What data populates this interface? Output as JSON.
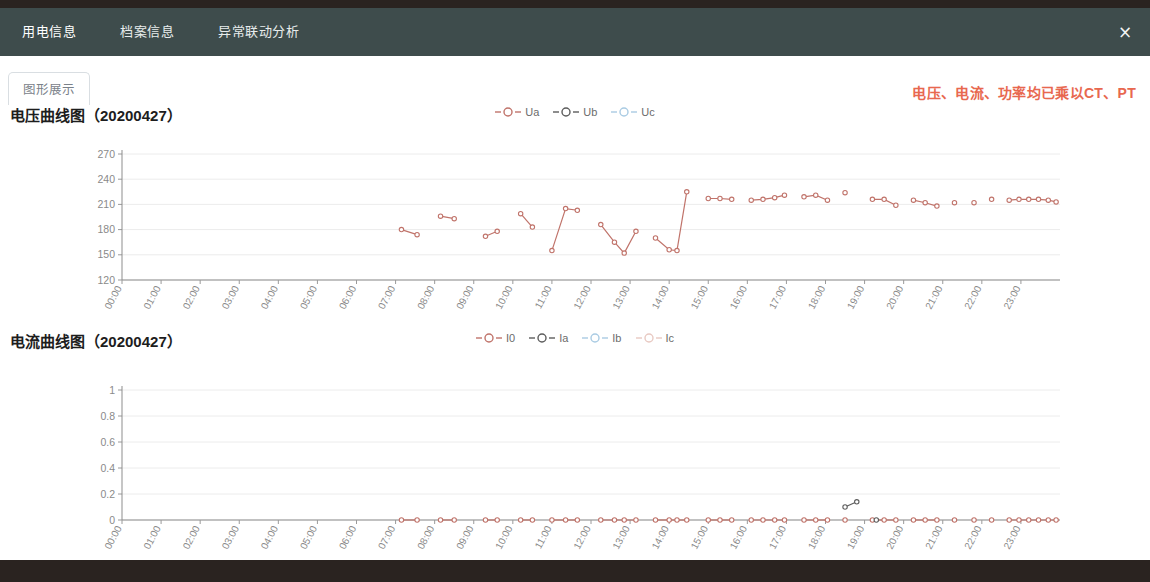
{
  "window": {
    "close_label": "×"
  },
  "nav": {
    "tabs": [
      {
        "label": "用电信息",
        "active": true
      },
      {
        "label": "档案信息",
        "active": false
      },
      {
        "label": "异常联动分析",
        "active": false
      }
    ]
  },
  "subtab": {
    "label": "图形展示"
  },
  "notice": {
    "text": "电压、电流、功率均已乘以CT、PT",
    "color": "#e8684f"
  },
  "colors": {
    "series_ua": "#c0736a",
    "series_ub": "#5c5c5c",
    "series_uc": "#a9cbe3",
    "series_i0": "#c0736a",
    "series_ia": "#5c5c5c",
    "series_ib": "#a9cbe3",
    "series_ic": "#e8c9c2",
    "grid": "#ececec",
    "axis": "#8d8d8d",
    "topbar": "#3e4c4c",
    "footer": "#2a2320"
  },
  "chart_data": [
    {
      "type": "line",
      "id": "voltage",
      "title": "电压曲线图（20200427）",
      "xlabel": "",
      "ylabel": "",
      "ylim": [
        120,
        270
      ],
      "yticks": [
        120,
        150,
        180,
        210,
        240,
        270
      ],
      "grid": true,
      "legend_position": "top-center",
      "x": [
        "00:00",
        "01:00",
        "02:00",
        "03:00",
        "04:00",
        "05:00",
        "06:00",
        "07:00",
        "08:00",
        "09:00",
        "10:00",
        "11:00",
        "12:00",
        "13:00",
        "14:00",
        "15:00",
        "16:00",
        "17:00",
        "18:00",
        "19:00",
        "20:00",
        "21:00",
        "22:00",
        "23:00"
      ],
      "xticks": [
        "00:00",
        "01:00",
        "02:00",
        "03:00",
        "04:00",
        "05:00",
        "06:00",
        "07:00",
        "08:00",
        "09:00",
        "10:00",
        "11:00",
        "12:00",
        "13:00",
        "14:00",
        "15:00",
        "16:00",
        "17:00",
        "18:00",
        "19:00",
        "20:00",
        "21:00",
        "22:00",
        "23:00"
      ],
      "series": [
        {
          "name": "Ua",
          "color": "#c0736a",
          "points": [
            {
              "t": 7.15,
              "v": 180
            },
            {
              "t": 7.55,
              "v": 174
            },
            {
              "t": 8.15,
              "v": 196
            },
            {
              "t": 8.5,
              "v": 193
            },
            {
              "t": 9.3,
              "v": 172
            },
            {
              "t": 9.6,
              "v": 178
            },
            {
              "t": 10.2,
              "v": 199
            },
            {
              "t": 10.5,
              "v": 183
            },
            {
              "t": 11.0,
              "v": 155
            },
            {
              "t": 11.35,
              "v": 205
            },
            {
              "t": 11.65,
              "v": 203
            },
            {
              "t": 12.25,
              "v": 186
            },
            {
              "t": 12.6,
              "v": 165
            },
            {
              "t": 12.85,
              "v": 152
            },
            {
              "t": 13.15,
              "v": 178
            },
            {
              "t": 13.65,
              "v": 170
            },
            {
              "t": 14.0,
              "v": 156
            },
            {
              "t": 14.2,
              "v": 155
            },
            {
              "t": 14.45,
              "v": 225
            },
            {
              "t": 15.0,
              "v": 217
            },
            {
              "t": 15.3,
              "v": 217
            },
            {
              "t": 15.6,
              "v": 216
            },
            {
              "t": 16.1,
              "v": 215
            },
            {
              "t": 16.4,
              "v": 216
            },
            {
              "t": 16.7,
              "v": 218
            },
            {
              "t": 16.95,
              "v": 221
            },
            {
              "t": 17.45,
              "v": 219
            },
            {
              "t": 17.75,
              "v": 221
            },
            {
              "t": 18.05,
              "v": 215
            },
            {
              "t": 18.5,
              "v": 224
            },
            {
              "t": 19.2,
              "v": 216
            },
            {
              "t": 19.5,
              "v": 216
            },
            {
              "t": 19.8,
              "v": 209
            },
            {
              "t": 20.25,
              "v": 215
            },
            {
              "t": 20.55,
              "v": 212
            },
            {
              "t": 20.85,
              "v": 208
            },
            {
              "t": 21.3,
              "v": 212
            },
            {
              "t": 21.8,
              "v": 212
            },
            {
              "t": 22.25,
              "v": 216
            },
            {
              "t": 22.7,
              "v": 215
            },
            {
              "t": 22.95,
              "v": 216
            },
            {
              "t": 23.2,
              "v": 216
            },
            {
              "t": 23.45,
              "v": 216
            },
            {
              "t": 23.7,
              "v": 215
            },
            {
              "t": 23.9,
              "v": 213
            }
          ]
        },
        {
          "name": "Ub",
          "color": "#5c5c5c",
          "points": []
        },
        {
          "name": "Uc",
          "color": "#a9cbe3",
          "points": []
        }
      ],
      "legend": [
        "Ua",
        "Ub",
        "Uc"
      ]
    },
    {
      "type": "line",
      "id": "current",
      "title": "电流曲线图（20200427）",
      "xlabel": "",
      "ylabel": "",
      "ylim": [
        0,
        1
      ],
      "yticks": [
        0,
        0.2,
        0.4,
        0.6,
        0.8,
        1
      ],
      "grid": true,
      "legend_position": "top-center",
      "x": [
        "00:00",
        "01:00",
        "02:00",
        "03:00",
        "04:00",
        "05:00",
        "06:00",
        "07:00",
        "08:00",
        "09:00",
        "10:00",
        "11:00",
        "12:00",
        "13:00",
        "14:00",
        "15:00",
        "16:00",
        "17:00",
        "18:00",
        "19:00",
        "20:00",
        "21:00",
        "22:00",
        "23:00"
      ],
      "xticks": [
        "00:00",
        "01:00",
        "02:00",
        "03:00",
        "04:00",
        "05:00",
        "06:00",
        "07:00",
        "08:00",
        "09:00",
        "10:00",
        "11:00",
        "12:00",
        "13:00",
        "14:00",
        "15:00",
        "16:00",
        "17:00",
        "18:00",
        "19:00",
        "20:00",
        "21:00",
        "22:00",
        "23:00"
      ],
      "series": [
        {
          "name": "I0",
          "color": "#c0736a",
          "points": [
            {
              "t": 7.15,
              "v": 0
            },
            {
              "t": 7.55,
              "v": 0
            },
            {
              "t": 8.15,
              "v": 0
            },
            {
              "t": 8.5,
              "v": 0
            },
            {
              "t": 9.3,
              "v": 0
            },
            {
              "t": 9.6,
              "v": 0
            },
            {
              "t": 10.2,
              "v": 0
            },
            {
              "t": 10.5,
              "v": 0
            },
            {
              "t": 11.0,
              "v": 0
            },
            {
              "t": 11.35,
              "v": 0
            },
            {
              "t": 11.65,
              "v": 0
            },
            {
              "t": 12.25,
              "v": 0
            },
            {
              "t": 12.6,
              "v": 0
            },
            {
              "t": 12.85,
              "v": 0
            },
            {
              "t": 13.15,
              "v": 0
            },
            {
              "t": 13.65,
              "v": 0
            },
            {
              "t": 14.0,
              "v": 0
            },
            {
              "t": 14.2,
              "v": 0
            },
            {
              "t": 14.45,
              "v": 0
            },
            {
              "t": 15.0,
              "v": 0
            },
            {
              "t": 15.3,
              "v": 0
            },
            {
              "t": 15.6,
              "v": 0
            },
            {
              "t": 16.1,
              "v": 0
            },
            {
              "t": 16.4,
              "v": 0
            },
            {
              "t": 16.7,
              "v": 0
            },
            {
              "t": 16.95,
              "v": 0
            },
            {
              "t": 17.45,
              "v": 0
            },
            {
              "t": 17.75,
              "v": 0
            },
            {
              "t": 18.05,
              "v": 0
            },
            {
              "t": 18.5,
              "v": 0
            },
            {
              "t": 19.2,
              "v": 0
            },
            {
              "t": 19.5,
              "v": 0
            },
            {
              "t": 19.8,
              "v": 0
            },
            {
              "t": 20.25,
              "v": 0
            },
            {
              "t": 20.55,
              "v": 0
            },
            {
              "t": 20.85,
              "v": 0
            },
            {
              "t": 21.3,
              "v": 0
            },
            {
              "t": 21.8,
              "v": 0
            },
            {
              "t": 22.25,
              "v": 0
            },
            {
              "t": 22.7,
              "v": 0
            },
            {
              "t": 22.95,
              "v": 0
            },
            {
              "t": 23.2,
              "v": 0
            },
            {
              "t": 23.45,
              "v": 0
            },
            {
              "t": 23.7,
              "v": 0
            },
            {
              "t": 23.9,
              "v": 0
            }
          ]
        },
        {
          "name": "Ia",
          "color": "#5c5c5c",
          "points": [
            {
              "t": 18.5,
              "v": 0.1
            },
            {
              "t": 18.8,
              "v": 0.14
            },
            {
              "t": 19.3,
              "v": 0
            }
          ]
        },
        {
          "name": "Ib",
          "color": "#a9cbe3",
          "points": []
        },
        {
          "name": "Ic",
          "color": "#e8c9c2",
          "points": []
        }
      ],
      "legend": [
        "I0",
        "Ia",
        "Ib",
        "Ic"
      ]
    }
  ]
}
